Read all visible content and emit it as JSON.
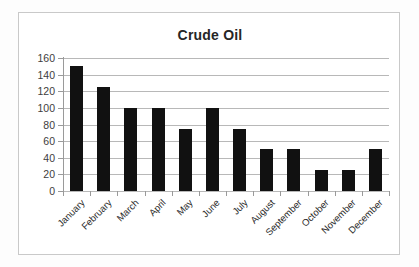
{
  "chart_data": {
    "type": "bar",
    "title": "Crude Oil",
    "xlabel": "",
    "ylabel": "",
    "categories": [
      "January",
      "February",
      "March",
      "April",
      "May",
      "June",
      "July",
      "August",
      "September",
      "October",
      "November",
      "December"
    ],
    "values": [
      150,
      125,
      100,
      100,
      75,
      100,
      75,
      50,
      50,
      25,
      25,
      51
    ],
    "series": [
      {
        "name": "Crude Oil",
        "values": [
          150,
          125,
          100,
          100,
          75,
          100,
          75,
          50,
          50,
          25,
          25,
          51
        ]
      }
    ],
    "ylim": [
      0,
      160
    ],
    "y_ticks": [
      0,
      20,
      40,
      60,
      80,
      100,
      120,
      140,
      160
    ],
    "y_tick_labels": [
      "0",
      "20",
      "40",
      "60",
      "80",
      "100",
      "120",
      "140",
      "160"
    ],
    "grid": true,
    "legend": false,
    "legend_position": "none",
    "bar_color": "#111111",
    "grid_color": "#b8b8b8",
    "axis_color": "#9a9a9a",
    "title_color": "#262626",
    "background": "#ffffff",
    "x_tick_label_rotation": -45
  }
}
